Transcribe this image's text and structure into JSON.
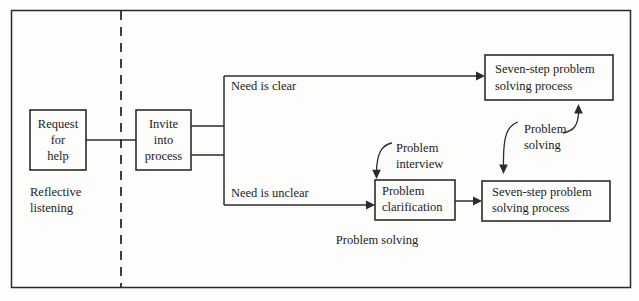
{
  "figure": {
    "type": "flowchart",
    "title": "",
    "background_color": "#fdfdfb",
    "line_color": "#2b2b2b",
    "frame": {
      "x": 11,
      "y": 10,
      "width": 620,
      "height": 278
    },
    "divider": {
      "orientation": "vertical",
      "x": 121,
      "style": "dashed"
    }
  },
  "nodes": {
    "request_for_help": {
      "label_line1": "Request",
      "label_line2": "for",
      "label_line3": "help",
      "x": 30,
      "y": 110,
      "width": 56,
      "height": 60
    },
    "invite_into_process": {
      "label_line1": "Invite",
      "label_line2": "into",
      "label_line3": "process",
      "x": 136,
      "y": 110,
      "width": 55,
      "height": 60
    },
    "problem_clarification": {
      "label_line1": "Problem",
      "label_line2": "clarification",
      "x": 375,
      "y": 180,
      "width": 80,
      "height": 40
    },
    "seven_step_top": {
      "label_line1": "Seven-step problem",
      "label_line2": "solving process",
      "x": 485,
      "y": 55,
      "width": 128,
      "height": 45
    },
    "seven_step_bottom": {
      "label_line1": "Seven-step problem",
      "label_line2": "solving process",
      "x": 482,
      "y": 181,
      "width": 128,
      "height": 40
    }
  },
  "edge_labels": {
    "need_is_clear": "Need is clear",
    "need_is_unclear": "Need is unclear"
  },
  "annotations": {
    "problem_interview_line1": "Problem",
    "problem_interview_line2": "interview",
    "problem_solving_curved_line1": "Problem",
    "problem_solving_curved_line2": "solving"
  },
  "zone_labels": {
    "reflective_listening_line1": "Reflective",
    "reflective_listening_line2": "listening",
    "problem_solving": "Problem solving"
  }
}
